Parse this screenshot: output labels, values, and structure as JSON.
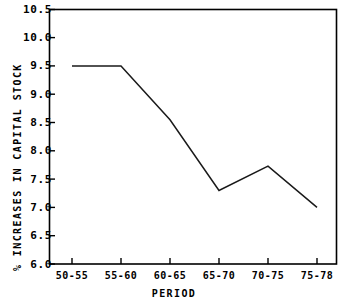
{
  "chart_data": {
    "type": "line",
    "title": "",
    "subtitle": "",
    "xlabel": "PERIOD",
    "ylabel": "% INCREASES IN CAPITAL STOCK",
    "categories": [
      "50-55",
      "55-60",
      "60-65",
      "65-70",
      "70-75",
      "75-78"
    ],
    "values": [
      9.5,
      9.5,
      8.55,
      7.3,
      7.73,
      7.0
    ],
    "series": [
      {
        "name": "% increases in capital stock",
        "values": [
          9.5,
          9.5,
          8.55,
          7.3,
          7.73,
          7.0
        ]
      }
    ],
    "ylim": [
      6.0,
      10.5
    ],
    "yticks": [
      "6.0",
      "6.5",
      "7.0",
      "7.5",
      "8.0",
      "8.5",
      "9.0",
      "9.5",
      "10.0",
      "10.5"
    ],
    "ytick_values": [
      6.0,
      6.5,
      7.0,
      7.5,
      8.0,
      8.5,
      9.0,
      9.5,
      10.0,
      10.5
    ],
    "xticks": [
      "50-55",
      "55-60",
      "60-65",
      "65-70",
      "70-75",
      "75-78"
    ],
    "grid": false,
    "legend": false,
    "legend_position": "none",
    "line_color": "#1a1a1a",
    "axis_color": "#000000",
    "background_color": "#ffffff",
    "markers": false,
    "annotations": []
  }
}
